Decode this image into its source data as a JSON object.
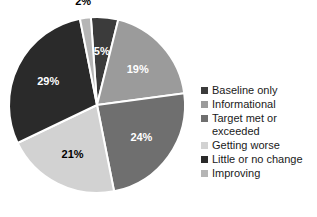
{
  "chart_data": {
    "type": "pie",
    "title": "",
    "categories": [
      "Baseline only",
      "Informational",
      "Target met or exceeded",
      "Getting worse",
      "Little or no change",
      "Improving"
    ],
    "values": [
      5,
      19,
      24,
      21,
      29,
      2
    ],
    "data_labels": [
      "5%",
      "19%",
      "24%",
      "21%",
      "29%",
      "2%"
    ],
    "colors": [
      "#3b3b3b",
      "#9b9b9b",
      "#6f6f6f",
      "#d2d2d2",
      "#2a2a2a",
      "#b5b5b5"
    ],
    "label_colors": [
      "#ffffff",
      "#ffffff",
      "#ffffff",
      "#000000",
      "#ffffff",
      "#000000"
    ],
    "slice_separator_color": "#ffffff",
    "legend_position": "right",
    "grid": false,
    "start_angle_deg": -4
  },
  "legend": {
    "items": [
      {
        "label": "Baseline only",
        "color": "#3b3b3b"
      },
      {
        "label": "Informational",
        "color": "#9b9b9b"
      },
      {
        "label": "Target met or\nexceeded",
        "color": "#6f6f6f"
      },
      {
        "label": "Getting worse",
        "color": "#d2d2d2"
      },
      {
        "label": "Little or no change",
        "color": "#2a2a2a"
      },
      {
        "label": "Improving",
        "color": "#b5b5b5"
      }
    ]
  }
}
